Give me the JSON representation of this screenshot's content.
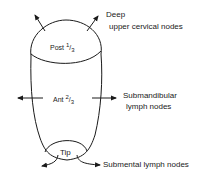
{
  "diagram": {
    "regions": [
      {
        "id": "post",
        "label": "Post",
        "fraction_num": "1",
        "fraction_den": "3"
      },
      {
        "id": "ant",
        "label": "Ant",
        "fraction_num": "2",
        "fraction_den": "3"
      },
      {
        "id": "tip",
        "label": "Tip"
      }
    ],
    "drainage": {
      "post": {
        "line1": "Deep",
        "line2": "upper cervical nodes"
      },
      "ant": {
        "line1": "Submandibular",
        "line2": "lymph nodes"
      },
      "tip": {
        "line1": "Submental lymph nodes"
      }
    },
    "colors": {
      "stroke": "#1a1a1a",
      "background": "#ffffff"
    }
  }
}
